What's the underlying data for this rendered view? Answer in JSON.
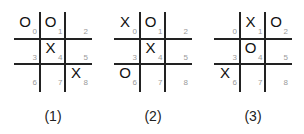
{
  "boards": [
    {
      "caption": "(1)",
      "cells": [
        {
          "index": "0",
          "mark": "O"
        },
        {
          "index": "1",
          "mark": "O"
        },
        {
          "index": "2",
          "mark": ""
        },
        {
          "index": "3",
          "mark": ""
        },
        {
          "index": "4",
          "mark": "X"
        },
        {
          "index": "5",
          "mark": ""
        },
        {
          "index": "6",
          "mark": ""
        },
        {
          "index": "7",
          "mark": ""
        },
        {
          "index": "8",
          "mark": "X"
        }
      ]
    },
    {
      "caption": "(2)",
      "cells": [
        {
          "index": "0",
          "mark": "X"
        },
        {
          "index": "1",
          "mark": "O"
        },
        {
          "index": "2",
          "mark": ""
        },
        {
          "index": "3",
          "mark": ""
        },
        {
          "index": "4",
          "mark": "X"
        },
        {
          "index": "5",
          "mark": ""
        },
        {
          "index": "6",
          "mark": "O"
        },
        {
          "index": "7",
          "mark": ""
        },
        {
          "index": "8",
          "mark": ""
        }
      ]
    },
    {
      "caption": "(3)",
      "cells": [
        {
          "index": "0",
          "mark": ""
        },
        {
          "index": "1",
          "mark": "X"
        },
        {
          "index": "2",
          "mark": "O"
        },
        {
          "index": "3",
          "mark": ""
        },
        {
          "index": "4",
          "mark": "O"
        },
        {
          "index": "5",
          "mark": ""
        },
        {
          "index": "6",
          "mark": "X"
        },
        {
          "index": "7",
          "mark": ""
        },
        {
          "index": "8",
          "mark": ""
        }
      ]
    }
  ]
}
